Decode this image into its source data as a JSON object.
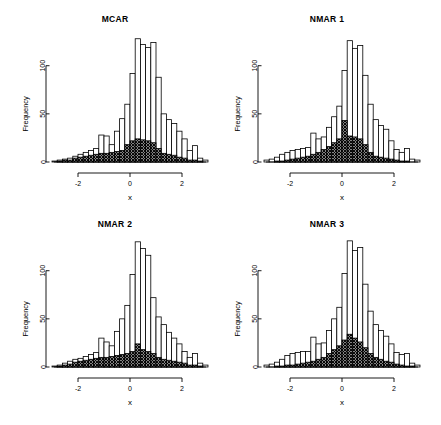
{
  "figure": {
    "layout": "2x2 grid of histograms",
    "background": "#ffffff",
    "foreground": "#000000"
  },
  "panels": [
    {
      "id": "mcar",
      "title": "MCAR",
      "xlabel": "x",
      "ylabel": "Frequency"
    },
    {
      "id": "nmar1",
      "title": "NMAR 1",
      "xlabel": "x",
      "ylabel": "Frequency"
    },
    {
      "id": "nmar2",
      "title": "NMAR 2",
      "xlabel": "x",
      "ylabel": "Frequency"
    },
    {
      "id": "nmar3",
      "title": "NMAR 3",
      "xlabel": "x",
      "ylabel": "Frequency"
    }
  ],
  "axis": {
    "x_ticks": [
      "-2",
      "0",
      "2"
    ],
    "x_tick_values": [
      -2,
      0,
      2
    ],
    "y_ticks": [
      "0",
      "50",
      "100"
    ],
    "y_tick_values": [
      0,
      50,
      100
    ],
    "xlim": [
      -3.0,
      3.0
    ],
    "ylim": [
      0,
      135
    ],
    "xlabel": "x",
    "ylabel": "Frequency"
  },
  "chart_data": [
    {
      "type": "bar",
      "subtype": "overlaid-histogram",
      "title": "MCAR",
      "xlabel": "x",
      "ylabel": "Frequency",
      "xlim": [
        -3.0,
        3.0
      ],
      "ylim": [
        0,
        135
      ],
      "grid": false,
      "legend": null,
      "bin_width": 0.2,
      "bin_edges": [
        -3.0,
        -2.8,
        -2.6,
        -2.4,
        -2.2,
        -2.0,
        -1.8,
        -1.6,
        -1.4,
        -1.2,
        -1.0,
        -0.8,
        -0.6,
        -0.4,
        -0.2,
        0.0,
        0.2,
        0.4,
        0.6,
        0.8,
        1.0,
        1.2,
        1.4,
        1.6,
        1.8,
        2.0,
        2.2,
        2.4,
        2.6,
        2.8,
        3.0
      ],
      "series": [
        {
          "name": "complete",
          "style": "hollow",
          "values": [
            1,
            2,
            3,
            4,
            6,
            8,
            10,
            12,
            14,
            28,
            27,
            18,
            32,
            45,
            60,
            92,
            128,
            122,
            119,
            124,
            88,
            50,
            44,
            40,
            32,
            24,
            12,
            17,
            4,
            2
          ]
        },
        {
          "name": "missing",
          "style": "crosshatch",
          "values": [
            0,
            1,
            2,
            2,
            4,
            5,
            6,
            7,
            8,
            9,
            9,
            10,
            11,
            12,
            18,
            22,
            24,
            23,
            22,
            20,
            14,
            9,
            8,
            7,
            5,
            4,
            2,
            2,
            1,
            0
          ]
        }
      ]
    },
    {
      "type": "bar",
      "subtype": "overlaid-histogram",
      "title": "NMAR 1",
      "xlabel": "x",
      "ylabel": "Frequency",
      "xlim": [
        -3.0,
        3.0
      ],
      "ylim": [
        0,
        135
      ],
      "grid": false,
      "legend": null,
      "bin_width": 0.2,
      "bin_edges": [
        -3.0,
        -2.8,
        -2.6,
        -2.4,
        -2.2,
        -2.0,
        -1.8,
        -1.6,
        -1.4,
        -1.2,
        -1.0,
        -0.8,
        -0.6,
        -0.4,
        -0.2,
        0.0,
        0.2,
        0.4,
        0.6,
        0.8,
        1.0,
        1.2,
        1.4,
        1.6,
        1.8,
        2.0,
        2.2,
        2.4,
        2.6,
        2.8,
        3.0
      ],
      "series": [
        {
          "name": "complete",
          "style": "hollow",
          "values": [
            2,
            3,
            5,
            8,
            10,
            12,
            13,
            14,
            15,
            30,
            24,
            26,
            36,
            47,
            58,
            95,
            126,
            118,
            121,
            90,
            60,
            44,
            38,
            34,
            22,
            13,
            10,
            14,
            3,
            2
          ]
        },
        {
          "name": "missing",
          "style": "crosshatch",
          "values": [
            0,
            0,
            1,
            1,
            2,
            3,
            4,
            5,
            6,
            8,
            10,
            13,
            16,
            20,
            24,
            43,
            27,
            26,
            24,
            18,
            10,
            6,
            5,
            4,
            3,
            2,
            1,
            1,
            0,
            0
          ]
        }
      ]
    },
    {
      "type": "bar",
      "subtype": "overlaid-histogram",
      "title": "NMAR 2",
      "xlabel": "x",
      "ylabel": "Frequency",
      "xlim": [
        -3.0,
        3.0
      ],
      "ylim": [
        0,
        135
      ],
      "grid": false,
      "legend": null,
      "bin_width": 0.2,
      "bin_edges": [
        -3.0,
        -2.8,
        -2.6,
        -2.4,
        -2.2,
        -2.0,
        -1.8,
        -1.6,
        -1.4,
        -1.2,
        -1.0,
        -0.8,
        -0.6,
        -0.4,
        -0.2,
        0.0,
        0.2,
        0.4,
        0.6,
        0.8,
        1.0,
        1.2,
        1.4,
        1.6,
        1.8,
        2.0,
        2.2,
        2.4,
        2.6,
        2.8,
        3.0
      ],
      "series": [
        {
          "name": "complete",
          "style": "hollow",
          "values": [
            1,
            2,
            4,
            6,
            8,
            9,
            11,
            13,
            15,
            30,
            26,
            22,
            37,
            50,
            64,
            96,
            130,
            123,
            116,
            72,
            52,
            44,
            36,
            30,
            24,
            16,
            10,
            14,
            4,
            2
          ]
        },
        {
          "name": "missing",
          "style": "crosshatch",
          "values": [
            0,
            1,
            2,
            3,
            5,
            6,
            7,
            8,
            9,
            10,
            10,
            11,
            12,
            13,
            14,
            16,
            24,
            18,
            16,
            14,
            10,
            8,
            7,
            6,
            5,
            4,
            2,
            2,
            1,
            0
          ]
        }
      ]
    },
    {
      "type": "bar",
      "subtype": "overlaid-histogram",
      "title": "NMAR 3",
      "xlabel": "x",
      "ylabel": "Frequency",
      "xlim": [
        -3.0,
        3.0
      ],
      "ylim": [
        0,
        135
      ],
      "grid": false,
      "legend": null,
      "bin_width": 0.2,
      "bin_edges": [
        -3.0,
        -2.8,
        -2.6,
        -2.4,
        -2.2,
        -2.0,
        -1.8,
        -1.6,
        -1.4,
        -1.2,
        -1.0,
        -0.8,
        -0.6,
        -0.4,
        -0.2,
        0.0,
        0.2,
        0.4,
        0.6,
        0.8,
        1.0,
        1.2,
        1.4,
        1.6,
        1.8,
        2.0,
        2.2,
        2.4,
        2.6,
        2.8,
        3.0
      ],
      "series": [
        {
          "name": "complete",
          "style": "hollow",
          "values": [
            2,
            3,
            5,
            8,
            12,
            14,
            15,
            16,
            16,
            31,
            24,
            25,
            38,
            50,
            62,
            97,
            131,
            121,
            124,
            86,
            58,
            44,
            38,
            32,
            24,
            15,
            13,
            14,
            4,
            2
          ]
        },
        {
          "name": "missing",
          "style": "crosshatch",
          "values": [
            0,
            0,
            1,
            1,
            2,
            2,
            3,
            4,
            5,
            6,
            8,
            10,
            14,
            18,
            22,
            28,
            34,
            30,
            26,
            20,
            14,
            10,
            8,
            6,
            5,
            3,
            2,
            1,
            1,
            0
          ]
        }
      ]
    }
  ]
}
